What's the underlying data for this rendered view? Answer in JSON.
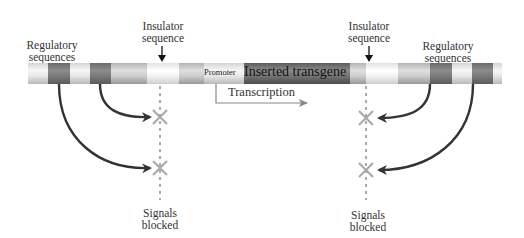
{
  "labels": {
    "regulatory_left": [
      "Regulatory",
      "sequences"
    ],
    "regulatory_right": [
      "Regulatory",
      "sequences"
    ],
    "insulator_left": [
      "Insulator",
      "sequence"
    ],
    "insulator_right": [
      "Insulator",
      "sequence"
    ],
    "promoter": "Promoter",
    "transgene": "Inserted transgene",
    "transcription": "Transcription",
    "blocked_left": [
      "Signals",
      "blocked"
    ],
    "blocked_right": [
      "Signals",
      "blocked"
    ]
  },
  "colors": {
    "arrow": "#333333",
    "insulator_line": "#aaaaaa",
    "blocked_x": "#aaaaaa",
    "transcription_arrow": "#888888",
    "text": "#333333"
  },
  "icons": {
    "down_arrow": "insulator-pointer-arrow",
    "blocked": "x-mark",
    "curved_arrow": "regulatory-signal-arrow"
  }
}
